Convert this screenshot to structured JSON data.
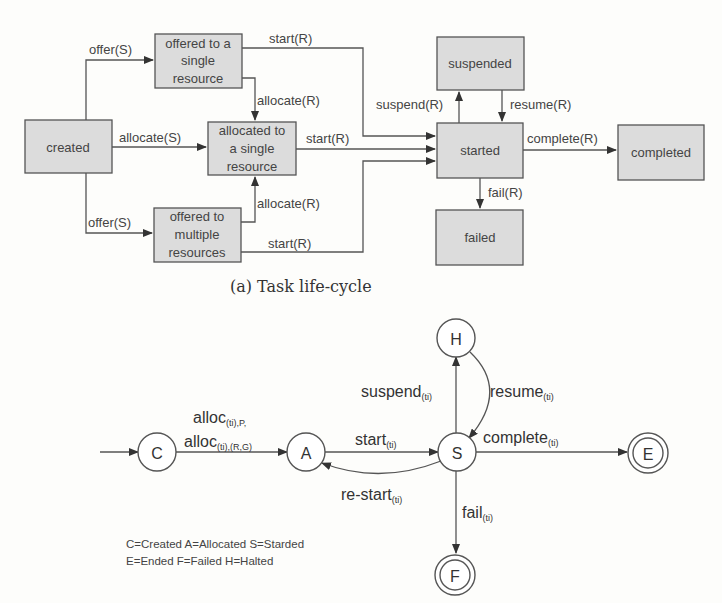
{
  "top_diagram": {
    "caption": "(a) Task life-cycle",
    "states": {
      "created": "created",
      "offered_single": [
        "offered to a",
        "single",
        "resource"
      ],
      "allocated_single": [
        "allocated to",
        "a single",
        "resource"
      ],
      "offered_multiple": [
        "offered to",
        "multiple",
        "resources"
      ],
      "suspended": "suspended",
      "started": "started",
      "completed": "completed",
      "failed": "failed"
    },
    "transitions": {
      "offer_single": "offer(S)",
      "offer_multiple": "offer(S)",
      "allocate_s": "allocate(S)",
      "allocate_r_from_single": "allocate(R)",
      "allocate_r_from_multiple": "allocate(R)",
      "start_from_offered_single": "start(R)",
      "start_from_allocated": "start(R)",
      "start_from_offered_multiple": "start(R)",
      "suspend": "suspend(R)",
      "resume": "resume(R)",
      "complete": "complete(R)",
      "fail": "fail(R)"
    }
  },
  "bottom_diagram": {
    "states": {
      "C": "C",
      "A": "A",
      "S": "S",
      "H": "H",
      "E": "E",
      "F": "F"
    },
    "transitions": {
      "alloc_p": {
        "base": "alloc",
        "sub": "(ti),P,"
      },
      "alloc_rg": {
        "base": "alloc",
        "sub": "(ti),(R,G)"
      },
      "start": {
        "base": "start",
        "sub": "(ti)"
      },
      "restart": {
        "base": "re-start",
        "sub": "(ti)"
      },
      "suspend": {
        "base": "suspend",
        "sub": "(ti)"
      },
      "resume": {
        "base": "resume",
        "sub": "(ti)"
      },
      "complete": {
        "base": "complete",
        "sub": "(ti)"
      },
      "fail": {
        "base": "fail",
        "sub": "(ti)"
      }
    },
    "legend": [
      "C=Created A=Allocated S=Starded",
      "E=Ended F=Failed H=Halted"
    ]
  }
}
